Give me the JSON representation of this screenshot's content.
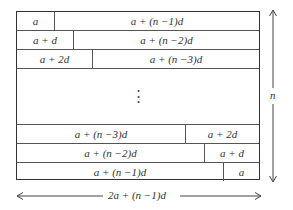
{
  "diagram": {
    "top_rows": [
      {
        "left": "a",
        "right": "a + (n −1)d",
        "split_px": 38
      },
      {
        "left": "a + d",
        "right": "a + (n −2)d",
        "split_px": 57
      },
      {
        "left": "a + 2d",
        "right": "a + (n −3)d",
        "split_px": 76
      }
    ],
    "ellipsis": "⋮",
    "bottom_rows": [
      {
        "left": "a + (n −3)d",
        "right": "a + 2d",
        "split_px": 169
      },
      {
        "left": "a + (n −2)d",
        "right": "a + d",
        "split_px": 188
      },
      {
        "left": "a + (n −1)d",
        "right": "a",
        "split_px": 207
      }
    ],
    "height_label": "n",
    "width_label": "2a + (n −1)d"
  }
}
